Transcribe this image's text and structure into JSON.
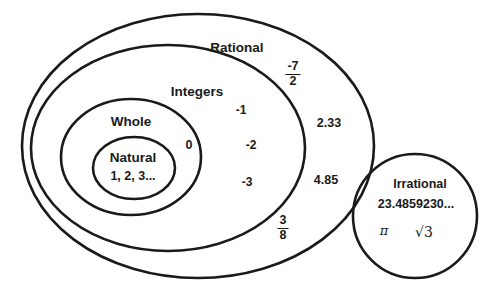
{
  "diagram": {
    "stroke_color": "#1a1a1a",
    "background_color": "#ffffff",
    "text_color": "#1a1a1a",
    "sets": [
      {
        "id": "rational",
        "label": "Rational"
      },
      {
        "id": "integers",
        "label": "Integers"
      },
      {
        "id": "whole",
        "label": "Whole"
      },
      {
        "id": "natural",
        "label": "Natural"
      },
      {
        "id": "irrational",
        "label": "Irrational"
      }
    ],
    "elements": {
      "natural": "1, 2, 3...",
      "whole": "0",
      "integers": [
        "-1",
        "-2",
        "-3"
      ],
      "rational": {
        "fraction_neg_seven_halves": {
          "numerator": "-7",
          "denominator": "2"
        },
        "decimal_2_33": "2.33",
        "decimal_4_85": "4.85",
        "fraction_three_eighths": {
          "numerator": "3",
          "denominator": "8"
        }
      },
      "irrational": {
        "decimal": "23.4859230...",
        "pi": "π",
        "sqrt3_radical": "√",
        "sqrt3_radicand": "3"
      }
    }
  }
}
